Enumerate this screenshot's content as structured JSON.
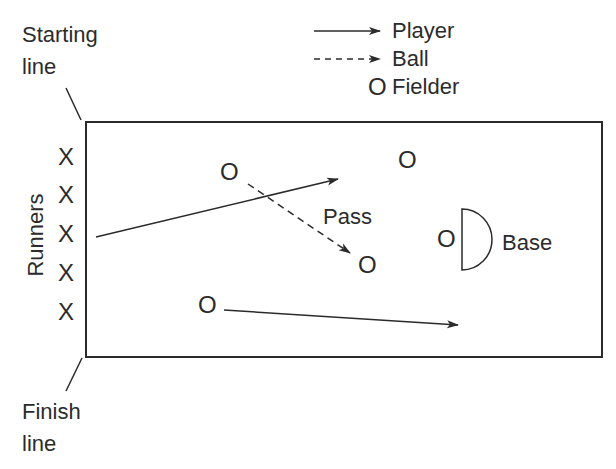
{
  "diagram": {
    "title": "",
    "legend": [
      {
        "label": "Player",
        "symbol": "solid-arrow"
      },
      {
        "label": "Ball",
        "symbol": "dashed-arrow"
      },
      {
        "label": "Fielder",
        "symbol": "O"
      }
    ],
    "labels": {
      "starting_line": "Starting line",
      "starting_line_1": "Starting",
      "starting_line_2": "line",
      "finish_line_1": "Finish",
      "finish_line_2": "line",
      "runners": "Runners",
      "pass": "Pass",
      "base": "Base"
    },
    "runner_symbol": "X",
    "fielder_symbol": "O",
    "runners_count": 5,
    "fielders_count": 5,
    "colors": {
      "line": "#2b2b2b",
      "background": "#ffffff"
    }
  }
}
